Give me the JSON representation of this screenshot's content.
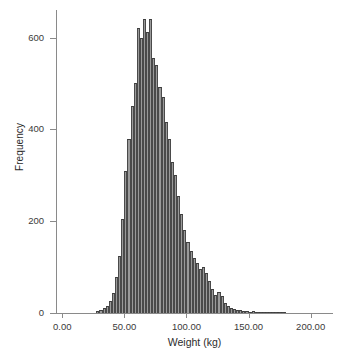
{
  "chart_data": {
    "type": "bar",
    "title": "",
    "subtitle": "",
    "xlabel": "Weight (kg)",
    "ylabel": "Frequency",
    "xlim": [
      -5,
      218
    ],
    "ylim": [
      0,
      660
    ],
    "grid": false,
    "legend": null,
    "bin_width": 2.5,
    "x_ticks": [
      {
        "value": 0,
        "label": "0.00"
      },
      {
        "value": 50,
        "label": "50.00"
      },
      {
        "value": 100,
        "label": "100.00"
      },
      {
        "value": 150,
        "label": "150.00"
      },
      {
        "value": 200,
        "label": "200.00"
      }
    ],
    "y_ticks": [
      {
        "value": 0,
        "label": "0"
      },
      {
        "value": 200,
        "label": "200"
      },
      {
        "value": 400,
        "label": "400"
      },
      {
        "value": 600,
        "label": "600"
      }
    ],
    "bin_centers": [
      28.75,
      31.25,
      33.75,
      36.25,
      38.75,
      41.25,
      43.75,
      46.25,
      48.75,
      51.25,
      53.75,
      56.25,
      58.75,
      61.25,
      63.75,
      66.25,
      68.75,
      71.25,
      73.75,
      76.25,
      78.75,
      81.25,
      83.75,
      86.25,
      88.75,
      91.25,
      93.75,
      96.25,
      98.75,
      101.25,
      103.75,
      106.25,
      108.75,
      111.25,
      113.75,
      116.25,
      118.75,
      121.25,
      123.75,
      126.25,
      128.75,
      131.25,
      133.75,
      136.25,
      138.75,
      141.25,
      143.75,
      146.25,
      148.75,
      151.25,
      153.75,
      156.25,
      158.75,
      161.25,
      163.75,
      166.25,
      168.75,
      171.25,
      173.75,
      176.25,
      178.75
    ],
    "values": [
      4,
      6,
      10,
      16,
      26,
      44,
      78,
      125,
      205,
      310,
      380,
      450,
      500,
      620,
      600,
      640,
      612,
      640,
      555,
      540,
      492,
      470,
      415,
      380,
      330,
      300,
      255,
      215,
      180,
      155,
      135,
      120,
      110,
      95,
      100,
      88,
      70,
      52,
      40,
      45,
      38,
      22,
      16,
      12,
      9,
      7,
      6,
      5,
      4,
      3,
      4,
      3,
      2,
      3,
      2,
      1,
      2,
      1,
      1,
      2,
      1
    ],
    "peak_value": 640,
    "peak_x": 71.25,
    "series_color": "#9a9a9a",
    "outline_color": "#3d3d3d",
    "axis_color": "#8a8a8a",
    "text_color": "#2b2b2b"
  },
  "axes": {
    "y_axis_name": "Frequency",
    "x_axis_name": "Weight (kg)"
  },
  "caption": ""
}
